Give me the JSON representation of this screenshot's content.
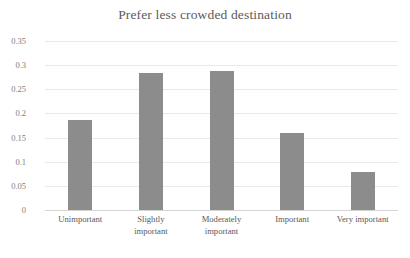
{
  "chart_data": {
    "type": "bar",
    "title": "Prefer less crowded destination",
    "xlabel": "",
    "ylabel": "",
    "categories": [
      "Unimportant",
      "Slightly important",
      "Moderately important",
      "Important",
      "Very important"
    ],
    "category_lines": [
      [
        "Unimportant"
      ],
      [
        "Slightly",
        "important"
      ],
      [
        "Moderately",
        "important"
      ],
      [
        "Important"
      ],
      [
        "Very important"
      ]
    ],
    "values": [
      0.187,
      0.284,
      0.288,
      0.16,
      0.079
    ],
    "ylim": [
      0,
      0.35
    ],
    "yticks": [
      0,
      0.05,
      0.1,
      0.15,
      0.2,
      0.25,
      0.3,
      0.35
    ],
    "ytick_labels": [
      "0",
      "0.05",
      "0.1",
      "0.15",
      "0.2",
      "0.25",
      "0.3",
      "0.35"
    ],
    "grid": true,
    "grid_axis": "y",
    "legend": false,
    "legend_position": "none",
    "bar_color": "#8c8c8c",
    "gridline_color": "#e9e9ea",
    "axis_color": "#d5d5d6",
    "title_color": "#5b5b5b",
    "tick_label_color": "#7d7d7d",
    "category_label_color": "#595959",
    "background_color": "#ffffff"
  }
}
